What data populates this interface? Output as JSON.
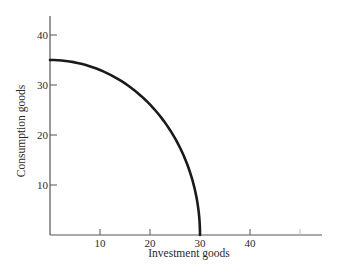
{
  "chart_data": {
    "type": "line",
    "title": "",
    "xlabel": "Investment goods",
    "ylabel": "Consumption goods",
    "xlim": [
      0,
      54
    ],
    "ylim": [
      0,
      44
    ],
    "x_ticks": [
      10,
      20,
      30,
      40,
      50
    ],
    "x_tick_labels": [
      "10",
      "20",
      "30",
      "40",
      ""
    ],
    "y_ticks": [
      10,
      20,
      30,
      40
    ],
    "y_tick_labels": [
      "10",
      "20",
      "30",
      "40"
    ],
    "grid": false,
    "legend": null,
    "series": [
      {
        "name": "Production possibility frontier",
        "color": "#1a1a1a",
        "x": [
          0,
          5,
          10,
          15,
          20,
          25,
          28,
          30
        ],
        "y": [
          35,
          32.6,
          29.6,
          25.6,
          20.2,
          13.5,
          7.5,
          0
        ]
      }
    ]
  },
  "colors": {
    "axis": "#555555",
    "curve": "#1a1a1a",
    "text": "#2a2a2a",
    "background": "#ffffff"
  }
}
